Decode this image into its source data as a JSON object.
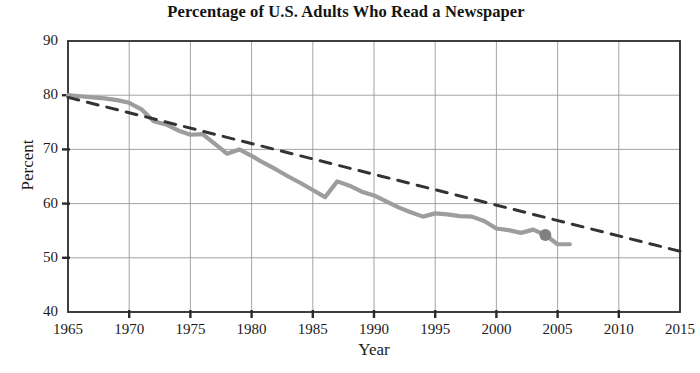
{
  "chart_data": {
    "type": "line",
    "title": "Percentage of U.S. Adults Who Read a Newspaper",
    "xlabel": "Year",
    "ylabel": "Percent",
    "xlim": [
      1965,
      2015
    ],
    "ylim": [
      40,
      90
    ],
    "xticks": [
      1965,
      1970,
      1975,
      1980,
      1985,
      1990,
      1995,
      2000,
      2005,
      2010,
      2015
    ],
    "xtick_labels": [
      "1965",
      "1970",
      "1975",
      "1980",
      "1985",
      "1990",
      "1995",
      "2000",
      "2005",
      "2010",
      "2015"
    ],
    "yticks": [
      40,
      50,
      60,
      70,
      80,
      90
    ],
    "ytick_labels": [
      "40",
      "50",
      "60",
      "70",
      "80",
      "90"
    ],
    "grid": true,
    "legend": "none",
    "series": [
      {
        "name": "Percent of U.S. adults who read a newspaper",
        "style": "solid",
        "color": "#9d9d9d",
        "width": 4.2,
        "x": [
          1965,
          1966,
          1967,
          1968,
          1969,
          1970,
          1971,
          1972,
          1973,
          1974,
          1975,
          1976,
          1977,
          1978,
          1979,
          1980,
          1981,
          1982,
          1983,
          1984,
          1985,
          1986,
          1987,
          1988,
          1989,
          1990,
          1991,
          1992,
          1993,
          1994,
          1995,
          1996,
          1997,
          1998,
          1999,
          2000,
          2001,
          2002,
          2003,
          2004,
          2005,
          2006
        ],
        "y": [
          80.0,
          79.8,
          79.6,
          79.4,
          79.1,
          78.6,
          77.4,
          75.2,
          74.6,
          73.5,
          72.7,
          72.8,
          71.0,
          69.2,
          70.0,
          68.8,
          67.5,
          66.3,
          65.0,
          63.8,
          62.5,
          61.2,
          64.1,
          63.3,
          62.2,
          61.5,
          60.4,
          59.3,
          58.4,
          57.6,
          58.2,
          58.0,
          57.7,
          57.6,
          56.8,
          55.4,
          55.1,
          54.6,
          55.2,
          54.2,
          52.5,
          52.5
        ]
      },
      {
        "name": "Linear trend",
        "style": "dashed",
        "color": "#333333",
        "width": 3.0,
        "x": [
          1965,
          2015
        ],
        "y": [
          79.6,
          51.2
        ]
      }
    ],
    "markers": [
      {
        "name": "highlight-point",
        "x": 2004,
        "y": 54.2,
        "color": "#808080",
        "radius": 6
      }
    ]
  }
}
